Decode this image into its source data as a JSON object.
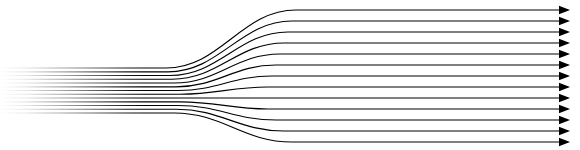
{
  "figure": {
    "name": "streamline-flow-diagram",
    "width": 580,
    "height": 150,
    "background_color": "#ffffff",
    "line_color": "#000000",
    "line_width": 1.15,
    "fade_start_x": 0,
    "fade_end_x": 130,
    "bundle_region": {
      "x_start": 0,
      "x_end": 165,
      "y_top": 68,
      "y_bottom": 113
    },
    "transition_region": {
      "x_start": 165,
      "x_end": 300
    },
    "fanned_region": {
      "x_start": 300,
      "x_end": 568,
      "y_top": 10,
      "y_bottom": 142
    },
    "arrowhead": {
      "name": "arrowhead",
      "length": 11,
      "half_width": 4.2,
      "tip_x": 570,
      "color": "#000000",
      "count": 13
    }
  },
  "chart_data": {
    "type": "line",
    "subtitle": "",
    "xlabel": "",
    "ylabel": "",
    "xlim": [
      0,
      580
    ],
    "ylim": [
      0,
      150
    ],
    "grid": false,
    "legend": null,
    "annotations": [],
    "tick_labels_x": [],
    "tick_labels_y": [],
    "series_count": 13,
    "series": [
      {
        "name": "streamline-1",
        "y_inlet": 68.0,
        "y_outlet": 10.0,
        "x_bend_start": 166,
        "x_bend_end": 296
      },
      {
        "name": "streamline-2",
        "y_inlet": 71.8,
        "y_outlet": 21.0,
        "x_bend_start": 168,
        "x_bend_end": 292
      },
      {
        "name": "streamline-3",
        "y_inlet": 75.5,
        "y_outlet": 32.0,
        "x_bend_start": 170,
        "x_bend_end": 288
      },
      {
        "name": "streamline-4",
        "y_inlet": 79.2,
        "y_outlet": 43.0,
        "x_bend_start": 172,
        "x_bend_end": 284
      },
      {
        "name": "streamline-5",
        "y_inlet": 83.0,
        "y_outlet": 54.0,
        "x_bend_start": 174,
        "x_bend_end": 280
      },
      {
        "name": "streamline-6",
        "y_inlet": 86.8,
        "y_outlet": 65.0,
        "x_bend_start": 176,
        "x_bend_end": 276
      },
      {
        "name": "streamline-7",
        "y_inlet": 90.5,
        "y_outlet": 76.0,
        "x_bend_start": 178,
        "x_bend_end": 272
      },
      {
        "name": "streamline-8",
        "y_inlet": 94.2,
        "y_outlet": 87.0,
        "x_bend_start": 180,
        "x_bend_end": 268
      },
      {
        "name": "streamline-9",
        "y_inlet": 98.0,
        "y_outlet": 98.0,
        "x_bend_start": 182,
        "x_bend_end": 264
      },
      {
        "name": "streamline-10",
        "y_inlet": 101.8,
        "y_outlet": 109.0,
        "x_bend_start": 180,
        "x_bend_end": 268
      },
      {
        "name": "streamline-11",
        "y_inlet": 105.5,
        "y_outlet": 120.0,
        "x_bend_start": 178,
        "x_bend_end": 276
      },
      {
        "name": "streamline-12",
        "y_inlet": 109.2,
        "y_outlet": 131.0,
        "x_bend_start": 176,
        "x_bend_end": 284
      },
      {
        "name": "streamline-13",
        "y_inlet": 113.0,
        "y_outlet": 142.0,
        "x_bend_start": 174,
        "x_bend_end": 292
      }
    ]
  }
}
